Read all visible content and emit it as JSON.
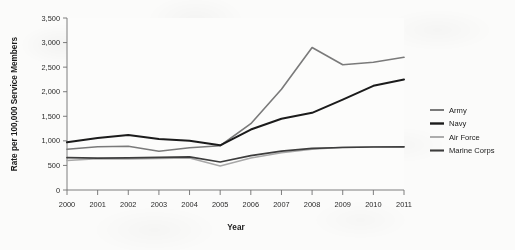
{
  "chart_data": {
    "type": "line",
    "title": "",
    "xlabel": "Year",
    "ylabel": "Rate per 100,000 Service Members",
    "x": [
      2000,
      2001,
      2002,
      2003,
      2004,
      2005,
      2006,
      2007,
      2008,
      2009,
      2010,
      2011
    ],
    "xticklabels": [
      "2000",
      "2001",
      "2002",
      "2003",
      "2004",
      "2005",
      "2006",
      "2007",
      "2008",
      "2009",
      "2010",
      "2011"
    ],
    "yticklabels": [
      "0",
      "500",
      "1,000",
      "1,500",
      "2,000",
      "2,500",
      "3,000",
      "3,500"
    ],
    "yticks": [
      0,
      500,
      1000,
      1500,
      2000,
      2500,
      3000,
      3500
    ],
    "ylim": [
      0,
      3500
    ],
    "xlim": [
      2000,
      2011
    ],
    "grid": false,
    "legend_position": "right",
    "series": [
      {
        "name": "Army",
        "color": "#7a7a7a",
        "width": 1.6,
        "values": [
          830,
          880,
          890,
          790,
          860,
          900,
          1350,
          2050,
          2900,
          2550,
          2600,
          2700
        ]
      },
      {
        "name": "Navy",
        "color": "#1b1b1b",
        "width": 2.0,
        "values": [
          970,
          1060,
          1120,
          1040,
          1000,
          910,
          1230,
          1450,
          1570,
          1840,
          2120,
          2250
        ]
      },
      {
        "name": "Air Force",
        "color": "#a8a8a8",
        "width": 1.5,
        "values": [
          600,
          635,
          630,
          640,
          650,
          490,
          650,
          760,
          830,
          870,
          880,
          880
        ]
      },
      {
        "name": "Marine Corps",
        "color": "#3d3d3d",
        "width": 1.7,
        "values": [
          660,
          650,
          655,
          665,
          675,
          570,
          700,
          790,
          845,
          865,
          875,
          878
        ]
      }
    ]
  },
  "legend": {
    "entries": [
      {
        "label": "Army"
      },
      {
        "label": "Navy"
      },
      {
        "label": "Air Force"
      },
      {
        "label": "Marine Corps"
      }
    ]
  }
}
